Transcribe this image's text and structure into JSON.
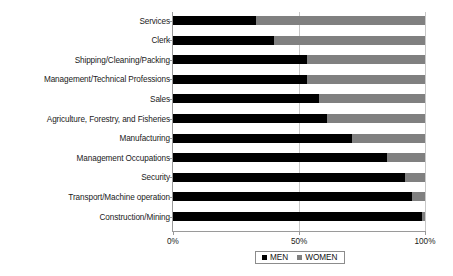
{
  "chart_data": {
    "type": "bar",
    "orientation": "horizontal",
    "stacked": true,
    "stacked_normalized": true,
    "title": "",
    "xlabel": "",
    "ylabel": "",
    "xlim": [
      0,
      100
    ],
    "xticks": [
      "0%",
      "50%",
      "100%"
    ],
    "xtick_values": [
      0,
      50,
      100
    ],
    "grid": true,
    "grid_axis": "x",
    "legend_position": "bottom",
    "categories": [
      "Services",
      "Clerk",
      "Shipping/Cleaning/Packing",
      "Management/Technical Professions",
      "Sales",
      "Agriculture, Forestry, and Fisheries",
      "Manufacturing",
      "Management Occupations",
      "Security",
      "Transport/Machine operation",
      "Construction/Mining"
    ],
    "series": [
      {
        "name": "MEN",
        "color": "#000000",
        "values": [
          33,
          40,
          53,
          53,
          58,
          61,
          71,
          85,
          92,
          95,
          99
        ]
      },
      {
        "name": "WOMEN",
        "color": "#808080",
        "values": [
          67,
          60,
          47,
          47,
          42,
          39,
          29,
          15,
          8,
          5,
          1
        ]
      }
    ]
  },
  "legend": {
    "items": [
      {
        "label": "MEN",
        "swatch": "men"
      },
      {
        "label": "WOMEN",
        "swatch": "women"
      }
    ]
  }
}
